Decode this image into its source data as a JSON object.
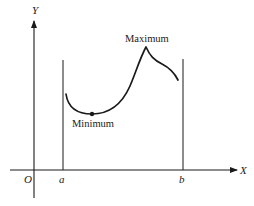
{
  "diagram": {
    "type": "function-extrema-on-interval",
    "axes": {
      "x_label": "X",
      "y_label": "Y",
      "origin_label": "O"
    },
    "interval": {
      "left_label": "a",
      "right_label": "b"
    },
    "annotations": {
      "maximum": "Maximum",
      "minimum": "Minimum"
    },
    "colors": {
      "ink": "#1a1a1a",
      "background": "#ffffff"
    }
  }
}
